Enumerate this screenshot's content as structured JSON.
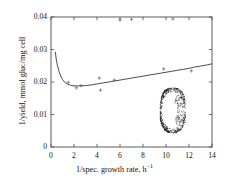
{
  "chart_data": {
    "type": "line",
    "title": "",
    "subtitle": "",
    "xlabel": "1/spec. growth rate, h",
    "xlabel_sup": "−1",
    "ylabel": "1/yield, mmol gluc/mg cell",
    "xlim": [
      0,
      14
    ],
    "ylim": [
      0,
      0.04
    ],
    "grid": false,
    "legend": "none",
    "xticks": [
      0,
      2,
      4,
      6,
      8,
      10,
      12,
      14
    ],
    "xticklabels": [
      "0",
      "2",
      "4",
      "6",
      "8",
      "10",
      "12",
      "14"
    ],
    "yticks": [
      0,
      0.01,
      0.02,
      0.03,
      0.04
    ],
    "yticklabels": [
      "0",
      "0.01",
      "0.02",
      "0.03",
      "0.04"
    ],
    "series": [
      {
        "name": "fitted model curve",
        "type": "line",
        "style": "solid",
        "color": "#2b2b2b",
        "x": [
          0.38,
          0.45,
          0.55,
          0.7,
          0.85,
          1.0,
          1.2,
          1.45,
          1.7,
          2.0,
          2.3,
          2.6,
          3.0,
          3.5,
          4.0,
          4.5,
          5.0,
          5.5,
          6.0,
          6.5,
          7.0,
          7.5,
          8.0,
          8.5,
          9.0,
          9.5,
          10.0,
          10.5,
          11.0,
          11.5,
          12.0,
          12.5,
          13.0,
          13.5,
          14.0
        ],
        "y": [
          0.0292,
          0.0272,
          0.0252,
          0.0232,
          0.0218,
          0.0208,
          0.0199,
          0.0193,
          0.019,
          0.0188,
          0.0188,
          0.0188,
          0.0189,
          0.0191,
          0.0194,
          0.0197,
          0.02,
          0.0203,
          0.0206,
          0.0209,
          0.0212,
          0.0215,
          0.0218,
          0.0221,
          0.0224,
          0.0227,
          0.023,
          0.0233,
          0.0236,
          0.0239,
          0.0242,
          0.0246,
          0.0249,
          0.0252,
          0.0256
        ]
      },
      {
        "name": "experimental data points",
        "type": "scatter",
        "marker": "plus",
        "color": "#4a4a4a",
        "x": [
          1.5,
          2.2,
          2.6,
          4.2,
          4.3,
          5.5,
          7.0,
          9.8,
          12.2,
          6.0,
          10.6
        ],
        "y": [
          0.0199,
          0.0182,
          0.0189,
          0.0212,
          0.0175,
          0.0206,
          0.0393,
          0.024,
          0.0234,
          0.0391,
          0.0394
        ]
      },
      {
        "name": "dense point cloud cluster",
        "type": "scatter",
        "marker": "dot",
        "color": "#1c1c1c",
        "shape": "filled-oval-ring",
        "x_range": [
          9.5,
          11.7
        ],
        "y_range": [
          0.0045,
          0.0182
        ],
        "center": [
          10.6,
          0.0113
        ],
        "n_points": 900
      }
    ]
  }
}
